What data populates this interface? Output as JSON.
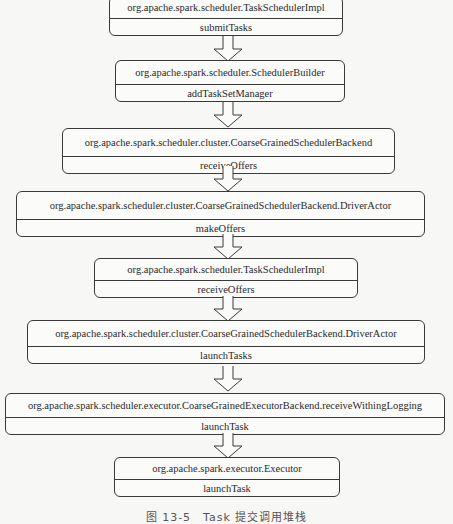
{
  "diagram": {
    "type": "call-stack-flow",
    "nodes": [
      {
        "class": "org.apache.spark.scheduler.TaskSchedulerImpl",
        "method": "submitTasks"
      },
      {
        "class": "org.apache.spark.scheduler.SchedulerBuilder",
        "method": "addTaskSetManager"
      },
      {
        "class": "org.apache.spark.scheduler.cluster.CoarseGrainedSchedulerBackend",
        "method": "receiveOffers"
      },
      {
        "class": "org.apache.spark.scheduler.cluster.CoarseGrainedSchedulerBackend.DriverActor",
        "method": "makeOffers"
      },
      {
        "class": "org.apache.spark.scheduler.TaskSchedulerImpl",
        "method": "receiveOffers"
      },
      {
        "class": "org.apache.spark.scheduler.cluster.CoarseGrainedSchedulerBackend.DriverActor",
        "method": "launchTasks"
      },
      {
        "class": "org.apache.spark.scheduler.executor.CoarseGrainedExecutorBackend.receiveWithingLogging",
        "method": "launchTask"
      },
      {
        "class": "org.apache.spark.executor.Executor",
        "method": "launchTask"
      }
    ],
    "edges": [
      [
        0,
        1
      ],
      [
        1,
        2
      ],
      [
        2,
        3
      ],
      [
        3,
        4
      ],
      [
        4,
        5
      ],
      [
        5,
        6
      ],
      [
        6,
        7
      ]
    ],
    "caption": "图 13-5　Task 提交调用堆栈"
  }
}
